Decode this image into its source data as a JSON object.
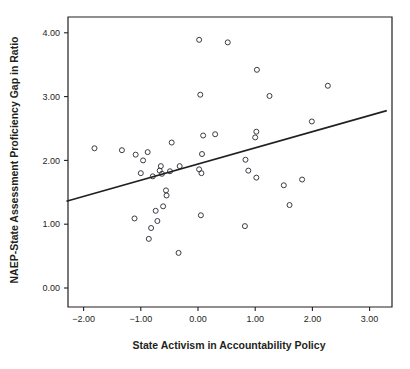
{
  "chart_data": {
    "type": "scatter",
    "title": "",
    "xlabel": "State Activism in Accountability Policy",
    "ylabel": "NAEP-State Assessment Proficiency Gap in Ratio",
    "xlim": [
      -2.3,
      3.3
    ],
    "ylim": [
      -0.3,
      4.3
    ],
    "xticks": [
      -2.0,
      -1.0,
      0.0,
      1.0,
      2.0,
      3.0
    ],
    "xtick_labels": [
      "−2.00",
      "−1.00",
      "0.00",
      "1.00",
      "2.00",
      "3.00"
    ],
    "yticks": [
      0.0,
      1.0,
      2.0,
      3.0,
      4.0
    ],
    "ytick_labels": [
      "0.00",
      "1.00",
      "2.00",
      "3.00",
      "4.00"
    ],
    "grid": false,
    "legend": null,
    "marker": "open-circle",
    "points": [
      {
        "x": -1.81,
        "y": 2.19
      },
      {
        "x": -1.33,
        "y": 2.16
      },
      {
        "x": -1.09,
        "y": 2.09
      },
      {
        "x": -0.96,
        "y": 2.0
      },
      {
        "x": -0.88,
        "y": 2.13
      },
      {
        "x": -1.0,
        "y": 1.8
      },
      {
        "x": -0.79,
        "y": 1.75
      },
      {
        "x": -0.67,
        "y": 1.84
      },
      {
        "x": -0.65,
        "y": 1.91
      },
      {
        "x": -0.63,
        "y": 1.79
      },
      {
        "x": -0.49,
        "y": 1.83
      },
      {
        "x": -0.46,
        "y": 2.28
      },
      {
        "x": -0.32,
        "y": 1.91
      },
      {
        "x": 0.02,
        "y": 1.86
      },
      {
        "x": 0.06,
        "y": 1.8
      },
      {
        "x": 0.07,
        "y": 2.1
      },
      {
        "x": 0.09,
        "y": 2.39
      },
      {
        "x": 0.3,
        "y": 2.41
      },
      {
        "x": 0.04,
        "y": 3.03
      },
      {
        "x": 0.02,
        "y": 3.89
      },
      {
        "x": 0.52,
        "y": 3.85
      },
      {
        "x": 1.03,
        "y": 3.42
      },
      {
        "x": 1.25,
        "y": 3.01
      },
      {
        "x": 2.27,
        "y": 3.17
      },
      {
        "x": 1.99,
        "y": 2.61
      },
      {
        "x": 1.02,
        "y": 2.45
      },
      {
        "x": 1.0,
        "y": 2.36
      },
      {
        "x": 0.83,
        "y": 2.01
      },
      {
        "x": 0.88,
        "y": 1.84
      },
      {
        "x": 1.02,
        "y": 1.73
      },
      {
        "x": 1.5,
        "y": 1.61
      },
      {
        "x": 1.82,
        "y": 1.7
      },
      {
        "x": 1.6,
        "y": 1.3
      },
      {
        "x": 0.82,
        "y": 0.97
      },
      {
        "x": 0.05,
        "y": 1.14
      },
      {
        "x": -0.56,
        "y": 1.53
      },
      {
        "x": -0.55,
        "y": 1.45
      },
      {
        "x": -0.61,
        "y": 1.28
      },
      {
        "x": -0.74,
        "y": 1.21
      },
      {
        "x": -0.71,
        "y": 1.05
      },
      {
        "x": -1.11,
        "y": 1.09
      },
      {
        "x": -0.82,
        "y": 0.94
      },
      {
        "x": -0.86,
        "y": 0.77
      },
      {
        "x": -0.34,
        "y": 0.55
      }
    ],
    "regression_line": {
      "x_start": -2.3,
      "y_start": 1.36,
      "x_end": 3.3,
      "y_end": 2.78
    }
  }
}
